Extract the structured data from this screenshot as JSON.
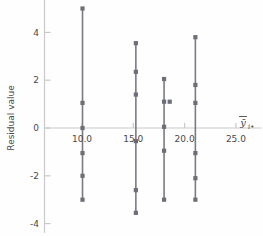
{
  "chart_data": {
    "type": "scatter",
    "title": "",
    "subtitle": "",
    "xlabel": "ȳ",
    "xlabel_sub": "i•",
    "ylabel": "Residual value",
    "xlim": [
      7.0,
      27.5
    ],
    "ylim": [
      -4.3,
      5.4
    ],
    "xticks": [
      10.0,
      15.0,
      20.0,
      25.0
    ],
    "xtick_labels": [
      "10.0",
      "15.0",
      "20.0",
      "25.0"
    ],
    "yticks": [
      4,
      2,
      0,
      -2,
      -4
    ],
    "ytick_labels": [
      "4",
      "2",
      "0",
      "-2",
      "-4"
    ],
    "grid": false,
    "legend": null,
    "zero_line": true,
    "marker_color": "#6e6e78",
    "line_color": "#7a7a84",
    "axis_color": "#c9c9c9",
    "text_color": "#4a4a4a",
    "groups": [
      {
        "name": "group-1",
        "x": 10.05,
        "connector": [
          -3.0,
          5.0
        ],
        "y": [
          5.0,
          1.05,
          0.0,
          -1.05,
          -2.0,
          -3.0
        ]
      },
      {
        "name": "group-2",
        "x": 15.25,
        "connector": [
          -3.55,
          3.55
        ],
        "y": [
          3.55,
          2.35,
          1.4,
          -0.55,
          -2.6,
          -3.55
        ]
      },
      {
        "name": "group-3",
        "x": 18.0,
        "connector": [
          -3.0,
          2.05
        ],
        "y": [
          2.05,
          1.1,
          0.05,
          -0.95,
          -3.0
        ]
      },
      {
        "name": "group-3-offset",
        "x": 18.55,
        "connector": null,
        "y": [
          1.1
        ]
      },
      {
        "name": "group-4",
        "x": 21.05,
        "connector": [
          -3.0,
          3.8
        ],
        "y": [
          3.8,
          1.8,
          1.05,
          -1.05,
          -2.1,
          -3.0
        ]
      }
    ]
  }
}
